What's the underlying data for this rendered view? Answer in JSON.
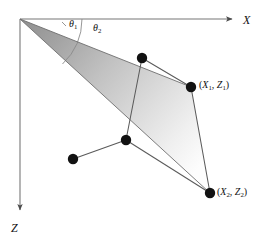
{
  "figure": {
    "name": "angular-sector-scanline-diagram",
    "background_color": "#ffffff",
    "stroke_color": "#595959",
    "dot_color": "#111111",
    "wedge_fill_dark": "#9a9a9a",
    "wedge_fill_light": "#fcfcfc"
  },
  "axes": {
    "x_label": "X",
    "z_label": "Z",
    "origin": {
      "x": 20,
      "y": 19
    },
    "x_axis_end": {
      "x": 238,
      "y": 19
    },
    "z_axis_end": {
      "x": 20,
      "y": 216
    }
  },
  "angles": {
    "theta1_label": "θ",
    "theta1_sub": "1",
    "theta2_label": "θ",
    "theta2_sub": "2",
    "arc_radius": 62
  },
  "points": [
    {
      "name": "vertex-top",
      "x": 142,
      "y": 58,
      "label": ""
    },
    {
      "name": "vertex-p1",
      "x": 191,
      "y": 87,
      "label": "(X1, Z1)"
    },
    {
      "name": "vertex-mid",
      "x": 126,
      "y": 140,
      "label": ""
    },
    {
      "name": "vertex-left",
      "x": 73,
      "y": 159,
      "label": ""
    },
    {
      "name": "vertex-p2",
      "x": 210,
      "y": 193,
      "label": "(X2, Z2)"
    }
  ],
  "point_labels": {
    "p1": {
      "open": "(",
      "x_sym": "X",
      "x_sub": "1",
      "comma": ", ",
      "z_sym": "Z",
      "z_sub": "1",
      "close": ")"
    },
    "p2": {
      "open": "(",
      "x_sym": "X",
      "x_sub": "2",
      "comma": ", ",
      "z_sym": "Z",
      "z_sub": "2",
      "close": ")"
    }
  },
  "wedge": {
    "apex": {
      "x": 20,
      "y": 19
    },
    "upper_ray_end": {
      "x": 191,
      "y": 87
    },
    "lower_ray_end": {
      "x": 210,
      "y": 193
    },
    "description": "shaded angular sector from origin spanning theta1 and theta2"
  },
  "polyline": {
    "description": "connected vertex chain of scanned surface points",
    "order": [
      "vertex-left",
      "vertex-mid",
      "vertex-top",
      "vertex-p1",
      "vertex-p2"
    ]
  }
}
